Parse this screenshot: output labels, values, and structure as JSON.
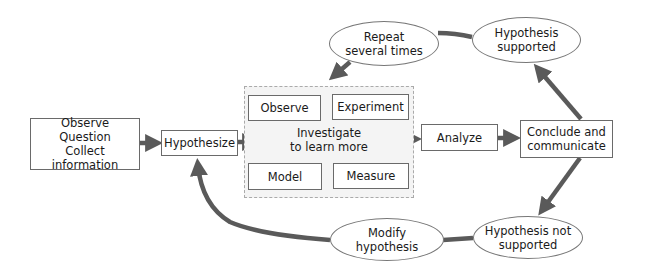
{
  "diagram": {
    "start_box": {
      "text": "Observe\nQuestion\nCollect information"
    },
    "hypothesize": {
      "text": "Hypothesize"
    },
    "investigate_group": {
      "label": "Investigate\nto learn more",
      "activities": [
        {
          "text": "Observe"
        },
        {
          "text": "Experiment"
        },
        {
          "text": "Model"
        },
        {
          "text": "Measure"
        }
      ]
    },
    "analyze": {
      "text": "Analyze"
    },
    "conclude": {
      "text": "Conclude and\ncommunicate"
    },
    "supported": {
      "text": "Hypothesis\nsupported"
    },
    "repeat": {
      "text": "Repeat\nseveral times"
    },
    "not_supported": {
      "text": "Hypothesis not\nsupported"
    },
    "modify": {
      "text": "Modify\nhypothesis"
    },
    "colors": {
      "arrow": "#5a5a5a",
      "border": "#6a6a6a",
      "dashed_fill": "#f4f4f4"
    }
  }
}
